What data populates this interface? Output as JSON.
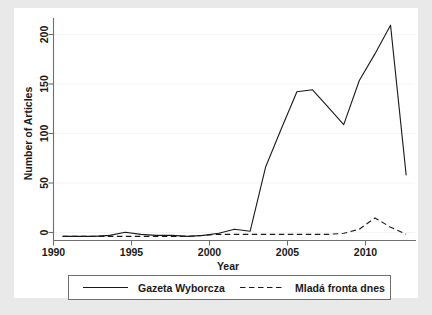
{
  "chart_data": {
    "type": "line",
    "title": "",
    "subtitle": "",
    "xlabel": "Year",
    "ylabel": "Number of Articles",
    "xlim": [
      1989.4,
      2012.6
    ],
    "ylim": [
      -4,
      213
    ],
    "xticks": [
      1990,
      1995,
      2000,
      2005,
      2010
    ],
    "xticklabels": [
      "1990",
      "1995",
      "2000",
      "2005",
      "2010"
    ],
    "yticks": [
      0,
      50,
      100,
      150,
      200
    ],
    "yticklabels": [
      "0",
      "50",
      "100",
      "150",
      "200"
    ],
    "grid": "horizontal-faint",
    "legend_position": "bottom-outside",
    "x": [
      1990,
      1991,
      1992,
      1993,
      1994,
      1995,
      1996,
      1997,
      1998,
      1999,
      2000,
      2001,
      2002,
      2003,
      2004,
      2005,
      2006,
      2007,
      2008,
      2009,
      2010,
      2011,
      2012
    ],
    "series": [
      {
        "name": "Gazeta Wyborcza",
        "style": "solid",
        "values": [
          0,
          0,
          0,
          1,
          4,
          2,
          1,
          1,
          0,
          1,
          3,
          7,
          5,
          68,
          105,
          141,
          143,
          126,
          109,
          152,
          178,
          206,
          60
        ]
      },
      {
        "name": "Mladá fronta dnes",
        "style": "dashed",
        "values": [
          0,
          0,
          0,
          0,
          0,
          0,
          0,
          0,
          0,
          1,
          2,
          2,
          2,
          2,
          2,
          2,
          2,
          2,
          3,
          7,
          18,
          9,
          2
        ]
      }
    ]
  },
  "legend": {
    "entries": [
      {
        "label": "Gazeta Wyborcza",
        "style": "solid"
      },
      {
        "label": "Mladá fronta dnes",
        "style": "dashed"
      }
    ]
  },
  "axes": {
    "x_title": "Year",
    "y_title": "Number of Articles",
    "x_labels": [
      "1990",
      "1995",
      "2000",
      "2005",
      "2010"
    ],
    "y_labels": [
      "0",
      "50",
      "100",
      "150",
      "200"
    ]
  },
  "colors": {
    "figure_background": "#e9e9e9",
    "canvas_background": "#ffffff",
    "line": "#1a1a1a",
    "axis": "#6f6f6f",
    "grid": "#f4f4f4",
    "text": "#1a1a1a"
  }
}
